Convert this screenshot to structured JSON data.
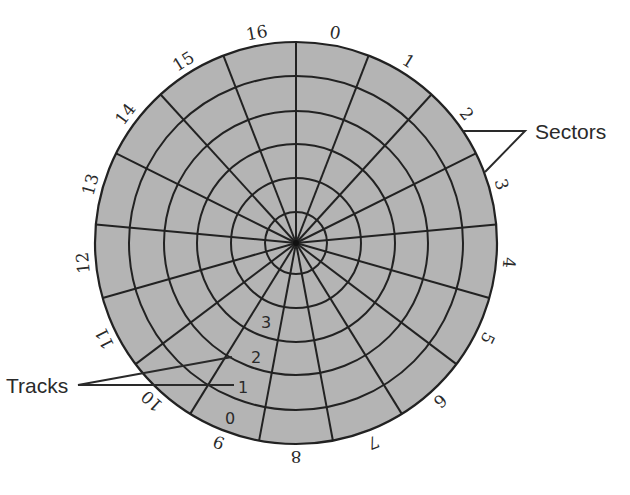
{
  "diagram": {
    "type": "disk-platter",
    "center": [
      296,
      243
    ],
    "outer_radius": 201,
    "ring_radii": [
      31,
      65,
      99,
      132,
      167
    ],
    "sector_count": 17,
    "colors": {
      "fill": "#b4b4b4",
      "lines": "#222222",
      "text": "#2a2a2a"
    },
    "sector_labels": [
      "0",
      "1",
      "2",
      "3",
      "4",
      "5",
      "6",
      "7",
      "8",
      "9",
      "10",
      "11",
      "12",
      "13",
      "14",
      "15",
      "16"
    ],
    "track_labels": [
      {
        "text": "0",
        "x": 230,
        "y": 424
      },
      {
        "text": "1",
        "x": 243,
        "y": 393
      },
      {
        "text": "2",
        "x": 256,
        "y": 363
      },
      {
        "text": "3",
        "x": 266,
        "y": 328
      }
    ],
    "callouts": {
      "sectors": {
        "label": "Sectors",
        "text_x": 535,
        "text_y": 139,
        "apex": [
          525,
          131
        ],
        "targets": [
          [
            463,
            131
          ],
          [
            485,
            172
          ]
        ]
      },
      "tracks": {
        "label": "Tracks",
        "text_x": 6,
        "text_y": 393,
        "apex": [
          78,
          385
        ],
        "targets": [
          [
            232,
            357
          ],
          [
            234,
            385
          ]
        ]
      }
    }
  }
}
